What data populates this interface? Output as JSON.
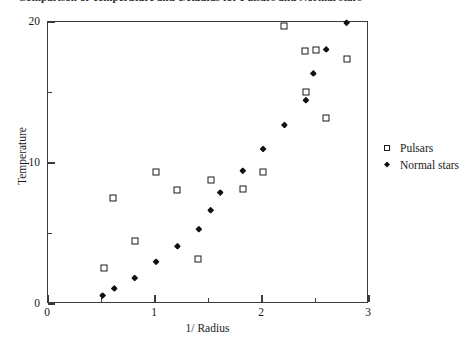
{
  "chart_data": {
    "type": "scatter",
    "title": "Comparison of Temperature and 1/Radius for Pulsars and Normal stars",
    "xlabel": "1/ Radius",
    "ylabel": "Temperature",
    "xlim": [
      0,
      3
    ],
    "ylim": [
      0,
      20
    ],
    "x_ticks_major": [
      0,
      1,
      2,
      3
    ],
    "x_ticks_major_labels": [
      "0",
      "1",
      "2",
      "3"
    ],
    "x_ticks_minor": [
      0.5,
      1.5,
      2.5
    ],
    "y_ticks_major": [
      0,
      10,
      20
    ],
    "y_ticks_major_labels": [
      "0",
      "10",
      "20"
    ],
    "y_ticks_minor": [
      5,
      15
    ],
    "grid": false,
    "legend_position": "right",
    "series": [
      {
        "name": "Pulsars",
        "marker": "open-square",
        "color": "#1b1b1b",
        "points": [
          [
            0.52,
            2.55
          ],
          [
            0.61,
            7.5
          ],
          [
            0.81,
            4.5
          ],
          [
            1.01,
            9.35
          ],
          [
            1.21,
            8.1
          ],
          [
            1.4,
            3.2
          ],
          [
            1.52,
            8.8
          ],
          [
            1.82,
            8.15
          ],
          [
            2.01,
            9.35
          ],
          [
            2.21,
            19.7
          ],
          [
            2.4,
            17.95
          ],
          [
            2.41,
            15.05
          ],
          [
            2.5,
            18.0
          ],
          [
            2.6,
            13.2
          ],
          [
            2.79,
            17.35
          ]
        ]
      },
      {
        "name": "Normal stars",
        "marker": "filled-diamond",
        "color": "#111111",
        "points": [
          [
            0.51,
            0.6
          ],
          [
            0.62,
            1.1
          ],
          [
            0.81,
            1.85
          ],
          [
            1.01,
            3.0
          ],
          [
            1.21,
            4.1
          ],
          [
            1.41,
            5.3
          ],
          [
            1.52,
            6.65
          ],
          [
            1.61,
            7.9
          ],
          [
            1.82,
            9.45
          ],
          [
            2.01,
            11.0
          ],
          [
            2.21,
            12.7
          ],
          [
            2.41,
            14.45
          ],
          [
            2.48,
            16.35
          ],
          [
            2.6,
            18.05
          ],
          [
            2.79,
            19.95
          ]
        ]
      }
    ]
  },
  "legend": {
    "items": [
      {
        "label": "Pulsars",
        "marker": "open-square"
      },
      {
        "label": "Normal stars",
        "marker": "filled-diamond"
      }
    ]
  }
}
